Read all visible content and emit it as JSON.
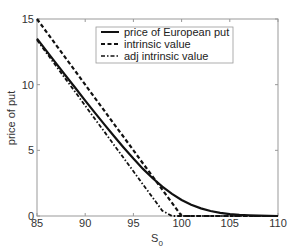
{
  "chart_data": {
    "type": "line",
    "title": "",
    "xlabel": "S",
    "xlabel_subscript": "0",
    "ylabel": "price of put",
    "xlim": [
      85,
      110
    ],
    "ylim": [
      0,
      15
    ],
    "xticks": [
      85,
      90,
      95,
      100,
      105,
      110
    ],
    "yticks": [
      0,
      5,
      10,
      15
    ],
    "grid": false,
    "legend_position": "top-right",
    "x": [
      85,
      86,
      87,
      88,
      89,
      90,
      91,
      92,
      93,
      94,
      95,
      96,
      97,
      98,
      99,
      100,
      101,
      102,
      103,
      104,
      105,
      106,
      107,
      108,
      109,
      110
    ],
    "series": [
      {
        "name": "price of European put",
        "style": "solid",
        "values": [
          13.5,
          12.55,
          11.6,
          10.66,
          9.72,
          8.79,
          7.87,
          6.96,
          6.07,
          5.2,
          4.37,
          3.59,
          2.87,
          2.23,
          1.68,
          1.22,
          0.86,
          0.58,
          0.38,
          0.24,
          0.14,
          0.08,
          0.05,
          0.03,
          0.01,
          0.0
        ]
      },
      {
        "name": "intrinsic value",
        "style": "dashed",
        "values": [
          15,
          14,
          13,
          12,
          11,
          10,
          9,
          8,
          7,
          6,
          5,
          4,
          3,
          2,
          1,
          0,
          0,
          0,
          0,
          0,
          0,
          0,
          0,
          0,
          0,
          0
        ]
      },
      {
        "name": "adj intrinsic value",
        "style": "dashdot",
        "values": [
          13.4,
          12.4,
          11.4,
          10.4,
          9.4,
          8.4,
          7.4,
          6.4,
          5.4,
          4.4,
          3.4,
          2.4,
          1.4,
          0.4,
          0,
          0,
          0,
          0,
          0,
          0,
          0,
          0,
          0,
          0,
          0,
          0
        ]
      }
    ]
  }
}
